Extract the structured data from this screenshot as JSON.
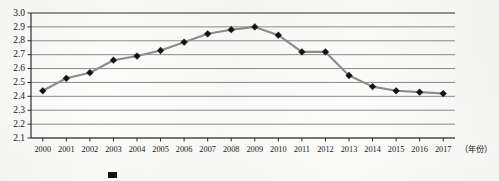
{
  "chart_data": {
    "type": "line",
    "title": "",
    "xlabel": "（年份）",
    "ylabel": "",
    "categories": [
      "2000",
      "2001",
      "2002",
      "2003",
      "2004",
      "2005",
      "2006",
      "2007",
      "2008",
      "2009",
      "2010",
      "2011",
      "2012",
      "2013",
      "2014",
      "2015",
      "2016",
      "2017"
    ],
    "values": [
      2.44,
      2.53,
      2.57,
      2.66,
      2.69,
      2.73,
      2.79,
      2.85,
      2.88,
      2.9,
      2.84,
      2.72,
      2.72,
      2.55,
      2.47,
      2.44,
      2.43,
      2.42
    ],
    "series": [
      {
        "name": "",
        "values": [
          2.44,
          2.53,
          2.57,
          2.66,
          2.69,
          2.73,
          2.79,
          2.85,
          2.88,
          2.9,
          2.84,
          2.72,
          2.72,
          2.55,
          2.47,
          2.44,
          2.43,
          2.42
        ]
      }
    ],
    "ylim": [
      2.1,
      3.0
    ],
    "yticks": [
      "3.0",
      "2.9",
      "2.8",
      "2.7",
      "2.6",
      "2.5",
      "2.4",
      "2.3",
      "2.2",
      "2.1"
    ],
    "ytick_values": [
      3.0,
      2.9,
      2.8,
      2.7,
      2.6,
      2.5,
      2.4,
      2.3,
      2.2,
      2.1
    ],
    "grid": true,
    "legend_position": "bottom",
    "marker": "diamond",
    "line_color": "#8d8d8d",
    "marker_color": "#131314",
    "gridline_color": "#6d6e70"
  },
  "axis": {
    "x_axis_title": "（年份）",
    "y_axis_title": ""
  },
  "legend": {
    "visible": true,
    "entries": [
      {
        "label": "",
        "swatch_color": "#131314"
      }
    ]
  }
}
